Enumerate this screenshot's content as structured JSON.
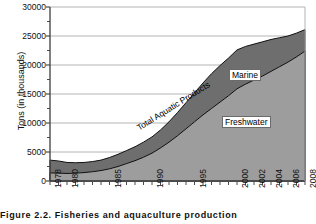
{
  "chart_data": {
    "type": "area",
    "title": "",
    "subtitle": "",
    "xlabel": "",
    "ylabel": "Tons (in thousands)",
    "stacked": true,
    "grid": true,
    "legend_position": "inline-annotations",
    "xlim": [
      1978,
      2008
    ],
    "ylim": [
      0,
      30000
    ],
    "y_ticks": [
      30000,
      25000,
      20000,
      15000,
      10000,
      5000,
      0
    ],
    "y_tick_labels": [
      "30000",
      "25000",
      "20000",
      "15000",
      "10000",
      "5000",
      "0"
    ],
    "x_tick_labels": [
      "1978",
      "1980",
      "1985",
      "1990",
      "1995",
      "2000",
      "2002",
      "2004",
      "2006",
      "2008"
    ],
    "x_tick_years": [
      1978,
      1980,
      1985,
      1990,
      1995,
      2000,
      2002,
      2004,
      2006,
      2008
    ],
    "x_minor_ticks_every": 1,
    "x": [
      1978,
      1979,
      1980,
      1981,
      1982,
      1983,
      1984,
      1985,
      1986,
      1987,
      1988,
      1989,
      1990,
      1991,
      1992,
      1993,
      1994,
      1995,
      1996,
      1997,
      1998,
      1999,
      2000,
      2001,
      2002,
      2003,
      2004,
      2005,
      2006,
      2007,
      2008
    ],
    "series": [
      {
        "name": "Freshwater",
        "color": "#9d9d9d",
        "values": [
          1400,
          1350,
          1300,
          1350,
          1450,
          1600,
          1800,
          2100,
          2500,
          3000,
          3500,
          4100,
          4800,
          5700,
          6700,
          7800,
          9000,
          10200,
          11400,
          12500,
          13600,
          14700,
          15900,
          16700,
          17400,
          18100,
          18900,
          19700,
          20500,
          21400,
          22400
        ]
      },
      {
        "name": "Marine",
        "color": "#6e6e6e",
        "values": [
          2200,
          2100,
          1900,
          1800,
          1750,
          1750,
          1800,
          1950,
          2100,
          2250,
          2400,
          2600,
          2800,
          3100,
          3500,
          4000,
          4500,
          5000,
          5500,
          6000,
          6300,
          6500,
          6700,
          6500,
          6200,
          5900,
          5500,
          5000,
          4500,
          4100,
          3700
        ]
      }
    ],
    "total_series": {
      "name": "Total Aquatic Products",
      "values": [
        3600,
        3450,
        3200,
        3150,
        3200,
        3350,
        3600,
        4050,
        4600,
        5250,
        5900,
        6700,
        7600,
        8800,
        10200,
        11800,
        13500,
        15200,
        16900,
        18500,
        19900,
        21200,
        22600,
        23200,
        23600,
        24000,
        24400,
        24700,
        25000,
        25500,
        26100
      ]
    },
    "annotations": [
      {
        "name": "marine-label",
        "text": "Marine"
      },
      {
        "name": "freshwater-label",
        "text": "Freshwater"
      },
      {
        "name": "total-label",
        "text": "Total Aquatic Products"
      }
    ]
  },
  "axes": {
    "y_title": "Tons (in thousands)",
    "y_tick_labels": [
      "30000",
      "25000",
      "20000",
      "15000",
      "10000",
      "5000",
      "0"
    ],
    "x_tick_labels": [
      "1978",
      "1980",
      "1985",
      "1990",
      "1995",
      "2000",
      "2002",
      "2004",
      "2006",
      "2008"
    ]
  },
  "labels": {
    "marine": "Marine",
    "freshwater": "Freshwater",
    "total": "Total Aquatic Products"
  },
  "caption": {
    "text": "Figure 2.2.  Fisheries and aquaculture production"
  },
  "colors": {
    "freshwater": "#9d9d9d",
    "marine": "#6e6e6e",
    "axis": "#4a4a4a",
    "grid": "#b0b0b0",
    "outline": "#111111",
    "background": "#ffffff"
  }
}
